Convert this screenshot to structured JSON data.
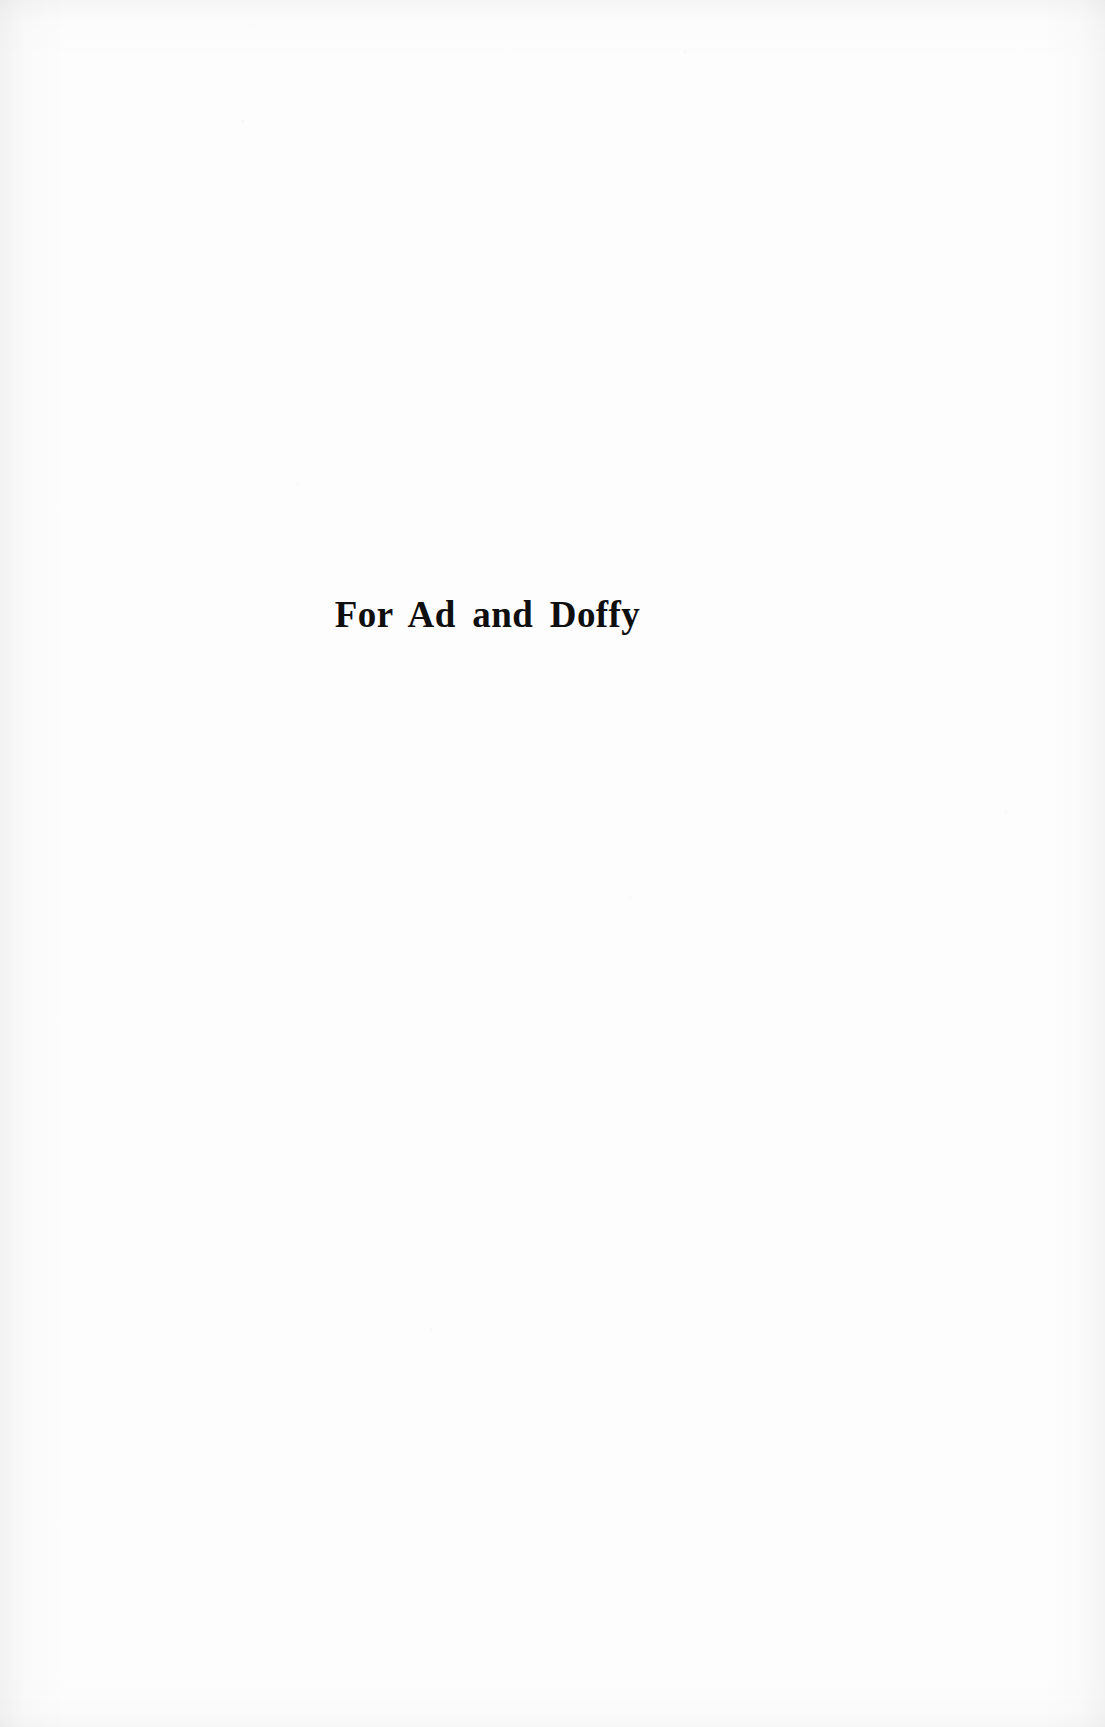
{
  "page": {
    "background_color": "#fdfdfd",
    "ink_color": "#100f10",
    "width_px": 1105,
    "height_px": 1727,
    "kind": "book-dedication-page"
  },
  "dedication": {
    "text": "For Ad and Doffy",
    "words": [
      "For",
      "Ad",
      "and",
      "Doffy"
    ],
    "alignment": "center",
    "typeface_style": "serif"
  }
}
